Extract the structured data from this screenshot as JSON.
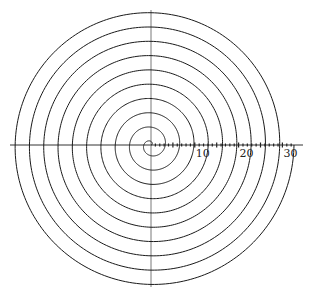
{
  "chart_data": {
    "type": "line",
    "title": "",
    "xlabel": "",
    "ylabel": "",
    "grid": false,
    "legend": null,
    "x_axis": {
      "ticks_every": 1,
      "labels": [
        {
          "value": 10,
          "text": "10"
        },
        {
          "value": 20,
          "text": "20"
        },
        {
          "value": 30,
          "text": "30"
        }
      ],
      "range": [
        0,
        32
      ]
    },
    "series": [
      {
        "name": "spiral",
        "equation": "r = b*theta",
        "turns": 10,
        "r_end_units": 32.5,
        "direction": "counterclockwise",
        "start_angle_deg": 0,
        "end_angle_deg": 3600
      }
    ]
  },
  "layout": {
    "width": 309,
    "height": 294,
    "center": {
      "x": 151,
      "y": 145
    },
    "px_per_unit": 4.38,
    "r_end_px": 143,
    "h_axis": {
      "x1": 10,
      "x2": 303
    },
    "v_axis": {
      "y1": 10,
      "y2": 287
    },
    "colors": {
      "line": "#1a1a1a",
      "axis": "#333333",
      "background": "#ffffff"
    }
  }
}
